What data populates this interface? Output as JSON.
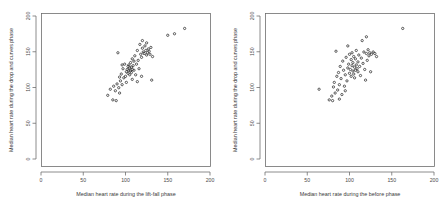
{
  "figure": {
    "background_color": "#ffffff",
    "panel_count": 2
  },
  "chart_data": [
    {
      "type": "scatter",
      "panel": "left",
      "title": "",
      "xlabel": "Median heart rate during the lift-fall phase",
      "ylabel": "Median heart rate during the drop and curves phase",
      "xlim": [
        0,
        200
      ],
      "ylim": [
        0,
        200
      ],
      "xticks": [
        0,
        50,
        100,
        150,
        200
      ],
      "yticks": [
        0,
        50,
        100,
        150,
        200
      ],
      "xtick_labels": [
        "0",
        "50",
        "100",
        "150",
        "200"
      ],
      "ytick_labels": [
        "0",
        "50",
        "100",
        "150",
        "200"
      ],
      "grid": false,
      "legend": false,
      "marker": "open-circle",
      "marker_color": "#2b2b2b",
      "points": [
        [
          79,
          93
        ],
        [
          82,
          101
        ],
        [
          85,
          87
        ],
        [
          86,
          105
        ],
        [
          88,
          99
        ],
        [
          89,
          86
        ],
        [
          90,
          108
        ],
        [
          91,
          149
        ],
        [
          92,
          103
        ],
        [
          93,
          96
        ],
        [
          94,
          112
        ],
        [
          95,
          121
        ],
        [
          96,
          107
        ],
        [
          97,
          128
        ],
        [
          98,
          116
        ],
        [
          99,
          134
        ],
        [
          100,
          118
        ],
        [
          101,
          124
        ],
        [
          102,
          127
        ],
        [
          103,
          131
        ],
        [
          103,
          122
        ],
        [
          104,
          126
        ],
        [
          104,
          133
        ],
        [
          105,
          120
        ],
        [
          105,
          129
        ],
        [
          106,
          125
        ],
        [
          106,
          136
        ],
        [
          107,
          123
        ],
        [
          107,
          130
        ],
        [
          108,
          127
        ],
        [
          108,
          141
        ],
        [
          109,
          132
        ],
        [
          110,
          126
        ],
        [
          110,
          138
        ],
        [
          111,
          145
        ],
        [
          112,
          120
        ],
        [
          113,
          134
        ],
        [
          114,
          152
        ],
        [
          115,
          139
        ],
        [
          116,
          128
        ],
        [
          117,
          160
        ],
        [
          118,
          147
        ],
        [
          119,
          143
        ],
        [
          120,
          155
        ],
        [
          120,
          165
        ],
        [
          121,
          150
        ],
        [
          122,
          148
        ],
        [
          123,
          158
        ],
        [
          124,
          152
        ],
        [
          125,
          146
        ],
        [
          125,
          162
        ],
        [
          126,
          149
        ],
        [
          127,
          154
        ],
        [
          128,
          151
        ],
        [
          129,
          147
        ],
        [
          130,
          156
        ],
        [
          131,
          113
        ],
        [
          132,
          144
        ],
        [
          119,
          118
        ],
        [
          114,
          111
        ],
        [
          108,
          114
        ],
        [
          101,
          110
        ],
        [
          96,
          133
        ],
        [
          93,
          117
        ],
        [
          150,
          172
        ],
        [
          158,
          174
        ],
        [
          170,
          181
        ]
      ]
    },
    {
      "type": "scatter",
      "panel": "right",
      "title": "",
      "xlabel": "Median heart rate during the before phase",
      "ylabel": "Median heart rate during the drop and curves phase",
      "xlim": [
        0,
        200
      ],
      "ylim": [
        0,
        200
      ],
      "xticks": [
        0,
        50,
        100,
        150,
        200
      ],
      "yticks": [
        0,
        50,
        100,
        150,
        200
      ],
      "xtick_labels": [
        "0",
        "50",
        "100",
        "150",
        "200"
      ],
      "ytick_labels": [
        "0",
        "50",
        "100",
        "150",
        "200"
      ],
      "grid": false,
      "legend": false,
      "marker": "open-circle",
      "marker_color": "#2b2b2b",
      "points": [
        [
          64,
          101
        ],
        [
          76,
          87
        ],
        [
          79,
          92
        ],
        [
          80,
          86
        ],
        [
          81,
          104
        ],
        [
          82,
          110
        ],
        [
          83,
          96
        ],
        [
          84,
          151
        ],
        [
          85,
          118
        ],
        [
          86,
          100
        ],
        [
          87,
          123
        ],
        [
          88,
          107
        ],
        [
          89,
          131
        ],
        [
          90,
          115
        ],
        [
          91,
          94
        ],
        [
          92,
          138
        ],
        [
          93,
          126
        ],
        [
          94,
          105
        ],
        [
          95,
          120
        ],
        [
          96,
          143
        ],
        [
          97,
          112
        ],
        [
          98,
          129
        ],
        [
          98,
          158
        ],
        [
          99,
          134
        ],
        [
          100,
          122
        ],
        [
          100,
          147
        ],
        [
          101,
          127
        ],
        [
          102,
          140
        ],
        [
          102,
          118
        ],
        [
          103,
          132
        ],
        [
          103,
          149
        ],
        [
          104,
          125
        ],
        [
          104,
          136
        ],
        [
          105,
          121
        ],
        [
          105,
          144
        ],
        [
          106,
          130
        ],
        [
          106,
          116
        ],
        [
          107,
          126
        ],
        [
          107,
          141
        ],
        [
          108,
          133
        ],
        [
          108,
          152
        ],
        [
          109,
          128
        ],
        [
          110,
          137
        ],
        [
          110,
          124
        ],
        [
          111,
          146
        ],
        [
          112,
          131
        ],
        [
          113,
          119
        ],
        [
          114,
          142
        ],
        [
          115,
          165
        ],
        [
          116,
          135
        ],
        [
          117,
          150
        ],
        [
          118,
          127
        ],
        [
          119,
          113
        ],
        [
          120,
          148
        ],
        [
          120,
          170
        ],
        [
          121,
          139
        ],
        [
          122,
          153
        ],
        [
          123,
          145
        ],
        [
          124,
          149
        ],
        [
          125,
          124
        ],
        [
          126,
          147
        ],
        [
          128,
          150
        ],
        [
          130,
          148
        ],
        [
          132,
          144
        ],
        [
          95,
          99
        ],
        [
          88,
          88
        ],
        [
          163,
          181
        ]
      ]
    }
  ]
}
